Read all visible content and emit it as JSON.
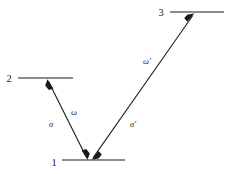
{
  "figure": {
    "kind": "energy-level-diagram",
    "background_color": "#ffffff",
    "ink_color": "#1a1a1a"
  },
  "levels": [
    {
      "id": "level-1",
      "label": "1",
      "label_x": 54,
      "label_y": 166,
      "line_x1": 62,
      "line_x2": 125,
      "line_y": 160
    },
    {
      "id": "level-2",
      "label": "2",
      "label_x": 9,
      "label_y": 82,
      "line_x1": 18,
      "line_x2": 73,
      "line_y": 78
    },
    {
      "id": "level-3",
      "label": "3",
      "label_x": 161,
      "label_y": 16,
      "line_x1": 170,
      "line_x2": 224,
      "line_y": 12
    }
  ],
  "transitions": [
    {
      "id": "transition-1-2",
      "from_x": 87,
      "from_y": 159,
      "to_x": 48,
      "to_y": 80,
      "double_headed": true,
      "labels": [
        {
          "id": "omega-label",
          "text": "ω",
          "prime": "",
          "x": 74,
          "y": 115
        },
        {
          "id": "sigma-label",
          "text": "σ",
          "prime": "",
          "x": 51,
          "y": 127
        }
      ]
    },
    {
      "id": "transition-1-3",
      "from_x": 93,
      "from_y": 159,
      "to_x": 194,
      "to_y": 14,
      "double_headed": true,
      "labels": [
        {
          "id": "omega-prime-label",
          "text": "ω",
          "prime": "′",
          "x": 147,
          "y": 64
        },
        {
          "id": "sigma-prime-label",
          "text": "σ",
          "prime": "′",
          "x": 133,
          "y": 127
        }
      ]
    }
  ],
  "labels": {
    "level_1": "1",
    "level_2": "2",
    "level_3": "3",
    "omega": "ω",
    "omega_prime": "ω′",
    "sigma": "σ",
    "sigma_prime": "σ′"
  }
}
